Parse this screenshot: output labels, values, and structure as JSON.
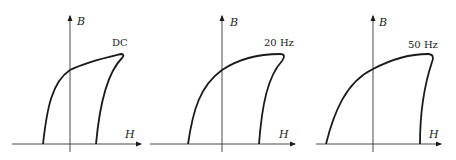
{
  "figure": {
    "panels": [
      {
        "id": "dc",
        "frequency_label": "DC",
        "y_axis_label": "B",
        "x_axis_label": "H"
      },
      {
        "id": "20hz",
        "frequency_label": "20 Hz",
        "y_axis_label": "B",
        "x_axis_label": "H"
      },
      {
        "id": "50hz",
        "frequency_label": "50 Hz",
        "y_axis_label": "B",
        "x_axis_label": "H"
      }
    ]
  },
  "colors": {
    "stroke": "#1a1a1a",
    "axis": "#333333",
    "background": "#ffffff"
  }
}
